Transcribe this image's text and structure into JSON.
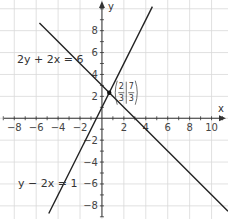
{
  "chart_data": {
    "type": "line",
    "title": "",
    "xlabel": "x",
    "ylabel": "y",
    "xlim": [
      -9.3,
      11.5
    ],
    "ylim": [
      -9.2,
      10.8
    ],
    "grid": true,
    "grid_step": 2,
    "minor_tick_step": 1,
    "x_ticks": [
      -8,
      -6,
      -4,
      -2,
      2,
      4,
      6,
      8,
      10
    ],
    "y_ticks": [
      -8,
      -6,
      -4,
      -2,
      2,
      4,
      6,
      8
    ],
    "series": [
      {
        "name": "2y + 2x = 6",
        "label": "2y + 2x = 6",
        "equation": "y = 3 - x",
        "slope": -1,
        "intercept": 3,
        "color": "#222222"
      },
      {
        "name": "y - 2x = 1",
        "label": "y − 2x = 1",
        "equation": "y = 2x + 1",
        "slope": 2,
        "intercept": 1,
        "color": "#222222"
      }
    ],
    "annotations": [
      {
        "type": "point",
        "name": "intersection",
        "x": 0.6667,
        "y": 2.3333,
        "label_num_x": "2",
        "label_den_x": "3",
        "label_num_y": "7",
        "label_den_y": "3"
      }
    ]
  },
  "colors": {
    "grid": "#d9d9d9",
    "axis": "#333333",
    "line": "#222222"
  }
}
